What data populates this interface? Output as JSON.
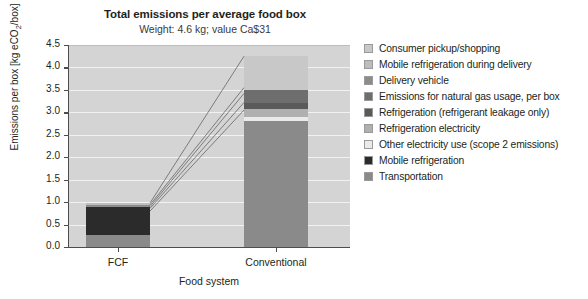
{
  "chart_data": {
    "type": "bar",
    "stacked": true,
    "title": "Total emissions per average food box",
    "subtitle": "Weight: 4.6 kg; value Ca$31",
    "xlabel": "Food system",
    "ylabel_text": "Emissions per box [kg eCO",
    "ylabel_sub": "2",
    "ylabel_tail": "/box]",
    "ylabel": "Emissions per box [kg eCO2/box]",
    "categories": [
      "FCF",
      "Conventional"
    ],
    "ylim": [
      0.0,
      4.5
    ],
    "ytick_labels": [
      "0.0",
      "0.5",
      "1.0",
      "1.5",
      "2.0",
      "2.5",
      "3.0",
      "3.5",
      "4.0",
      "4.5"
    ],
    "ytick_values": [
      0.0,
      0.5,
      1.0,
      1.5,
      2.0,
      2.5,
      3.0,
      3.5,
      4.0,
      4.5
    ],
    "grid": true,
    "legend_position": "right",
    "series": [
      {
        "name": "Consumer pickup/shopping",
        "color": "#c8c8c8",
        "values": [
          0.0,
          0.75
        ]
      },
      {
        "name": "Mobile refrigeration during delivery",
        "color": "#bdbdbd",
        "values": [
          0.04,
          0.0
        ]
      },
      {
        "name": "Delivery vehicle",
        "color": "#8c8c8c",
        "values": [
          0.06,
          0.0
        ]
      },
      {
        "name": "Emissions for natural gas usage, per box",
        "color": "#6e6e6e",
        "values": [
          0.0,
          0.3
        ]
      },
      {
        "name": "Refrigeration (refrigerant leakage only)",
        "color": "#5a5a5a",
        "values": [
          0.0,
          0.12
        ]
      },
      {
        "name": "Refrigeration electricity",
        "color": "#b0b0b0",
        "values": [
          0.0,
          0.18
        ]
      },
      {
        "name": "Other electricity use (scope 2 emissions)",
        "color": "#eaeaea",
        "values": [
          0.0,
          0.1
        ]
      },
      {
        "name": "Mobile refrigeration",
        "color": "#2b2b2b",
        "values": [
          0.62,
          0.0
        ]
      },
      {
        "name": "Transportation",
        "color": "#8a8a8a",
        "values": [
          0.26,
          2.8
        ]
      }
    ],
    "totals": [
      0.98,
      4.25
    ]
  },
  "legend": {
    "items": [
      {
        "label": "Consumer pickup/shopping",
        "color": "#c8c8c8"
      },
      {
        "label": "Mobile refrigeration during delivery",
        "color": "#bdbdbd"
      },
      {
        "label": "Delivery vehicle",
        "color": "#8c8c8c"
      },
      {
        "label": "Emissions for natural gas usage, per box",
        "color": "#6e6e6e"
      },
      {
        "label": "Refrigeration (refrigerant leakage only)",
        "color": "#5a5a5a"
      },
      {
        "label": "Refrigeration electricity",
        "color": "#b0b0b0"
      },
      {
        "label": "Other electricity use (scope 2 emissions)",
        "color": "#eaeaea"
      },
      {
        "label": "Mobile refrigeration",
        "color": "#2b2b2b"
      },
      {
        "label": "Transportation",
        "color": "#8a8a8a"
      }
    ]
  },
  "colors": {
    "plot_background": "#d4d4d4",
    "gridline": "#f2f2f2",
    "axis": "#4d4d4d",
    "text": "#231f20",
    "connector": "#555555"
  }
}
